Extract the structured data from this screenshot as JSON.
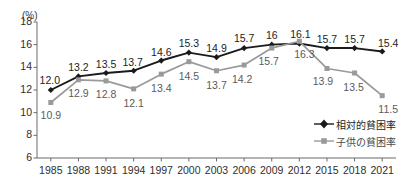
{
  "chart_data": {
    "type": "line",
    "title": "",
    "xlabel": "",
    "ylabel": "(%)",
    "unit_label": "(%)",
    "categories": [
      "1985",
      "1988",
      "1991",
      "1994",
      "1997",
      "2000",
      "2003",
      "2006",
      "2009",
      "2012",
      "2015",
      "2018",
      "2021"
    ],
    "ylim": [
      6,
      18
    ],
    "yticks": [
      6,
      8,
      10,
      12,
      14,
      16,
      18
    ],
    "ytick_labels": [
      "6",
      "8",
      "10",
      "12",
      "14",
      "16",
      "18"
    ],
    "grid": false,
    "legend_position": "inside-bottom-right",
    "series": [
      {
        "name": "相対的貧困率",
        "color": "#1a1a1a",
        "marker": "diamond",
        "values": [
          12.0,
          13.2,
          13.5,
          13.7,
          14.6,
          15.3,
          14.9,
          15.7,
          16,
          16.1,
          15.7,
          15.7,
          15.4
        ],
        "labels": [
          "12.0",
          "13.2",
          "13.5",
          "13.7",
          "14.6",
          "15.3",
          "14.9",
          "15.7",
          "16",
          "16.1",
          "15.7",
          "15.7",
          "15.4"
        ]
      },
      {
        "name": "子供の貧困率",
        "color": "#9a9a9a",
        "marker": "square",
        "values": [
          10.9,
          12.9,
          12.8,
          12.1,
          13.4,
          14.5,
          13.7,
          14.2,
          15.7,
          16.3,
          13.9,
          13.5,
          11.5
        ],
        "labels": [
          "10.9",
          "12.9",
          "12.8",
          "12.1",
          "13.4",
          "14.5",
          "13.7",
          "14.2",
          "15.7",
          "16.3",
          "13.9",
          "13.5",
          "11.5"
        ]
      }
    ]
  },
  "legend": {
    "items": [
      {
        "label": "相対的貧困率",
        "marker": "diamond-marker-icon"
      },
      {
        "label": "子供の貧困率",
        "marker": "square-marker-icon"
      }
    ]
  },
  "colors": {
    "series_adult": "#1a1a1a",
    "series_child": "#9a9a9a",
    "axis": "#6b6b6b",
    "text": "#1d1d1d",
    "background": "#ffffff"
  }
}
